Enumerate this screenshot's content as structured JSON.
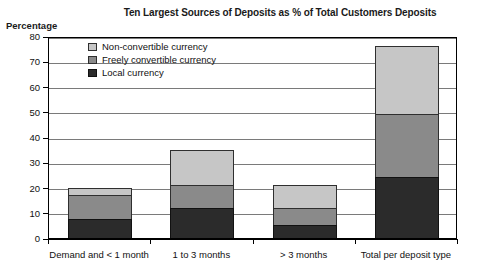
{
  "chart_data": {
    "type": "bar",
    "stacked": true,
    "title": "Ten Largest Sources of Deposits as % of Total Customers Deposits",
    "ylabel": "Percentage",
    "xlabel": "",
    "ylim": [
      0,
      80
    ],
    "yticks": [
      0,
      10,
      20,
      30,
      40,
      50,
      60,
      70,
      80
    ],
    "grid": true,
    "legend_position": "top-left inside",
    "categories": [
      "Demand and < 1 month",
      "1 to 3 months",
      "> 3 months",
      "Total per deposit type"
    ],
    "series": [
      {
        "name": "Local currency",
        "color": "#2b2b2b",
        "values": [
          7.5,
          12,
          5,
          24
        ]
      },
      {
        "name": "Freely convertible currency",
        "color": "#8a8a8a",
        "values": [
          9.5,
          9,
          7,
          25
        ]
      },
      {
        "name": "Non-convertible currency",
        "color": "#c6c6c6",
        "values": [
          3,
          14,
          9,
          27
        ]
      }
    ],
    "totals": [
      20,
      35,
      21,
      76
    ]
  },
  "legend": {
    "items": [
      {
        "label": "Non-convertible currency",
        "key": "nonconv"
      },
      {
        "label": "Freely convertible currency",
        "key": "freely"
      },
      {
        "label": "Local currency",
        "key": "local"
      }
    ]
  }
}
